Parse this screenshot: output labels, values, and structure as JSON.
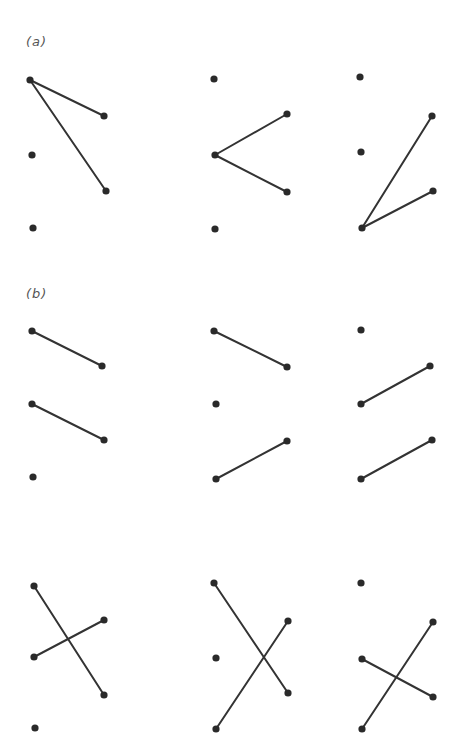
{
  "panels": [
    {
      "label": "(a)",
      "label_pos": [
        26,
        48
      ],
      "diagrams": [
        {
          "nodes": [
            [
              30,
              80
            ],
            [
              32,
              155
            ],
            [
              33,
              228
            ],
            [
              104,
              116
            ],
            [
              106,
              191
            ]
          ],
          "edges": [
            [
              [
                30,
                80
              ],
              [
                104,
                116
              ]
            ],
            [
              [
                30,
                80
              ],
              [
                106,
                191
              ]
            ]
          ]
        },
        {
          "nodes": [
            [
              214,
              79
            ],
            [
              215,
              155
            ],
            [
              215,
              229
            ],
            [
              287,
              114
            ],
            [
              287,
              192
            ]
          ],
          "edges": [
            [
              [
                215,
                155
              ],
              [
                287,
                114
              ]
            ],
            [
              [
                215,
                155
              ],
              [
                287,
                192
              ]
            ]
          ]
        },
        {
          "nodes": [
            [
              360,
              77
            ],
            [
              361,
              152
            ],
            [
              362,
              228
            ],
            [
              432,
              116
            ],
            [
              433,
              191
            ]
          ],
          "edges": [
            [
              [
                362,
                228
              ],
              [
                432,
                116
              ]
            ],
            [
              [
                362,
                228
              ],
              [
                433,
                191
              ]
            ]
          ]
        }
      ]
    },
    {
      "label": "(b)",
      "label_pos": [
        26,
        300
      ],
      "diagrams": [
        {
          "nodes": [
            [
              32,
              331
            ],
            [
              32,
              404
            ],
            [
              33,
              477
            ],
            [
              102,
              366
            ],
            [
              104,
              440
            ]
          ],
          "edges": [
            [
              [
                32,
                331
              ],
              [
                102,
                366
              ]
            ],
            [
              [
                32,
                404
              ],
              [
                104,
                440
              ]
            ]
          ]
        },
        {
          "nodes": [
            [
              214,
              331
            ],
            [
              216,
              404
            ],
            [
              216,
              479
            ],
            [
              287,
              367
            ],
            [
              287,
              441
            ]
          ],
          "edges": [
            [
              [
                214,
                331
              ],
              [
                287,
                367
              ]
            ],
            [
              [
                216,
                479
              ],
              [
                287,
                441
              ]
            ]
          ]
        },
        {
          "nodes": [
            [
              361,
              330
            ],
            [
              361,
              404
            ],
            [
              361,
              479
            ],
            [
              430,
              366
            ],
            [
              432,
              440
            ]
          ],
          "edges": [
            [
              [
                361,
                404
              ],
              [
                430,
                366
              ]
            ],
            [
              [
                361,
                479
              ],
              [
                432,
                440
              ]
            ]
          ]
        },
        {
          "nodes": [
            [
              34,
              586
            ],
            [
              34,
              657
            ],
            [
              35,
              728
            ],
            [
              104,
              620
            ],
            [
              104,
              695
            ]
          ],
          "edges": [
            [
              [
                34,
                586
              ],
              [
                104,
                695
              ]
            ],
            [
              [
                34,
                657
              ],
              [
                104,
                620
              ]
            ]
          ]
        },
        {
          "nodes": [
            [
              214,
              583
            ],
            [
              216,
              658
            ],
            [
              216,
              729
            ],
            [
              288,
              621
            ],
            [
              288,
              693
            ]
          ],
          "edges": [
            [
              [
                214,
                583
              ],
              [
                288,
                693
              ]
            ],
            [
              [
                216,
                729
              ],
              [
                288,
                621
              ]
            ]
          ]
        },
        {
          "nodes": [
            [
              361,
              583
            ],
            [
              362,
              659
            ],
            [
              362,
              729
            ],
            [
              433,
              622
            ],
            [
              433,
              697
            ]
          ],
          "edges": [
            [
              [
                362,
                659
              ],
              [
                433,
                697
              ]
            ],
            [
              [
                362,
                729
              ],
              [
                433,
                622
              ]
            ]
          ]
        }
      ]
    }
  ],
  "colors": {
    "edge": "#333333",
    "node": "#2a2a2a",
    "label": "#555555"
  }
}
